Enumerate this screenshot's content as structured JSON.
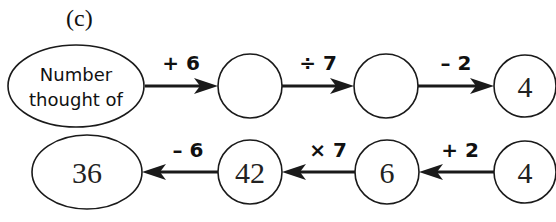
{
  "part_label": "(c)",
  "forward_row": {
    "start_label_line1": "Number",
    "start_label_line2": "thought of",
    "nodes": [
      "",
      "",
      "4"
    ],
    "operations": [
      "+ 6",
      "÷ 7",
      "– 2"
    ]
  },
  "reverse_row": {
    "nodes": [
      "36",
      "42",
      "6",
      "4"
    ],
    "operations": [
      "– 6",
      "× 7",
      "+ 2"
    ]
  }
}
